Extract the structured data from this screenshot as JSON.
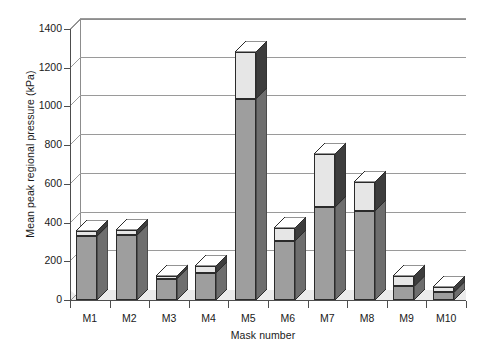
{
  "chart_data": {
    "type": "bar",
    "stacked": true,
    "three_d": true,
    "title": "",
    "xlabel": "Mask number",
    "ylabel": "Mean peak regional pressure (kPa)",
    "categories": [
      "M1",
      "M2",
      "M3",
      "M4",
      "M5",
      "M6",
      "M7",
      "M8",
      "M9",
      "M10"
    ],
    "ylim": [
      0,
      1400
    ],
    "yticks": [
      0,
      200,
      400,
      600,
      800,
      1000,
      1200,
      1400
    ],
    "ytick_labels": [
      "0",
      "200",
      "400",
      "600",
      "800",
      "1000",
      "1200",
      "1400"
    ],
    "grid": true,
    "legend": "none",
    "series": [
      {
        "name": "lower-segment",
        "color": "#9e9e9e",
        "values": [
          330,
          335,
          110,
          140,
          1040,
          305,
          480,
          460,
          70,
          40
        ]
      },
      {
        "name": "upper-segment",
        "color": "#e6e6e6",
        "values": [
          25,
          25,
          15,
          35,
          240,
          65,
          275,
          150,
          55,
          25
        ]
      }
    ],
    "totals": [
      355,
      360,
      125,
      175,
      1280,
      370,
      755,
      610,
      125,
      65
    ]
  },
  "axes": {
    "y_title": "Mean peak regional pressure (kPa)",
    "x_title": "Mask number"
  },
  "colors": {
    "bar_lower": "#9e9e9e",
    "bar_upper": "#e6e6e6",
    "bar_outline": "#2b2b2b",
    "gridline": "#9a9a9a",
    "axis": "#4d4d4d",
    "floor": "#ebebeb",
    "background": "#ffffff"
  }
}
